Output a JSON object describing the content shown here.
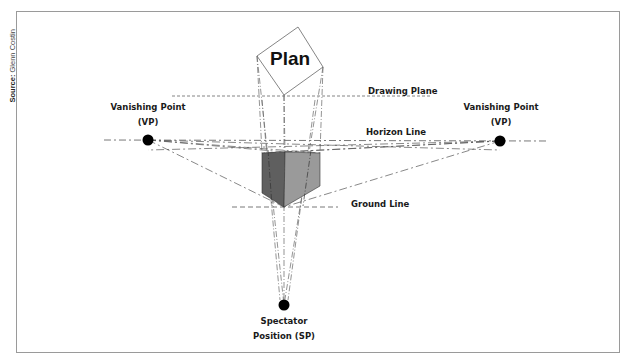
{
  "source": {
    "prefix": "Source:",
    "name": "Glenn Costin"
  },
  "labels": {
    "plan": "Plan",
    "drawing_plane": "Drawing Plane",
    "horizon_line": "Horizon Line",
    "ground_line": "Ground Line",
    "vp_left_line1": "Vanishing Point",
    "vp_left_line2": "(VP)",
    "vp_right_line1": "Vanishing Point",
    "vp_right_line2": "(VP)",
    "sp_line1": "Spectator",
    "sp_line2": "Position (SP)"
  },
  "points": {
    "vp_left": [
      148,
      140
    ],
    "vp_right": [
      500,
      141
    ],
    "sp": [
      284,
      305
    ]
  },
  "colors": {
    "cube_left_face": "#5f5f5f",
    "cube_right_face": "#9a9a9a",
    "line": "#555555",
    "border": "#9a9a9a"
  }
}
